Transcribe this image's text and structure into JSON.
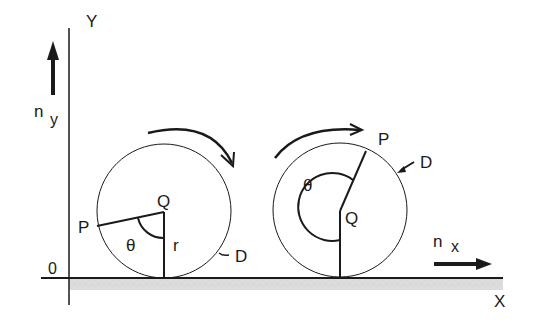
{
  "diagram": {
    "axes": {
      "y_label": "Y",
      "x_label": "X",
      "origin_label": "0",
      "ny_label": "n",
      "ny_sub": "y",
      "nx_label": "n",
      "nx_sub": "x"
    },
    "wheel_left": {
      "center_label": "Q",
      "point_label": "P",
      "angle_label": "θ",
      "radius_label": "r",
      "disk_label": "D"
    },
    "wheel_right": {
      "center_label": "Q",
      "point_label": "P",
      "angle_label": "θ",
      "disk_label": "D"
    },
    "colors": {
      "line": "#1a1a1a",
      "ground": "#d9d9d9"
    }
  }
}
